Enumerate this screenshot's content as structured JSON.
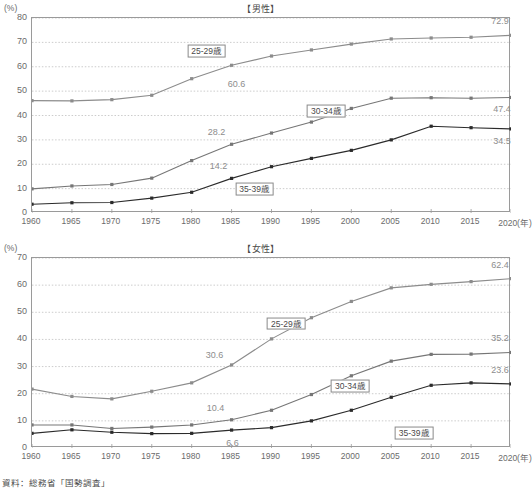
{
  "figure": {
    "source_note": "資料：総務省「国勢調査」",
    "axis_unit": "(%)",
    "x_axis_suffix": "(年)",
    "colors": {
      "series_25_29": "#8c8c8c",
      "series_30_34": "#767676",
      "series_35_39": "#2b2b2b",
      "grid": "#bfbfbf",
      "frame": "#9a9a9a",
      "label_text": "#8d8d8d"
    }
  },
  "charts": [
    {
      "id": "male",
      "title": "【男性】",
      "chart_data": {
        "type": "line",
        "title": "【男性】",
        "xlabel": "(年)",
        "ylabel": "(%)",
        "ylim": [
          0,
          80
        ],
        "ytick_step": 10,
        "yticks": [
          0,
          10,
          20,
          30,
          40,
          50,
          60,
          70,
          80
        ],
        "grid": true,
        "legend": "inline-labels",
        "categories": [
          1960,
          1965,
          1970,
          1975,
          1980,
          1985,
          1990,
          1995,
          2000,
          2005,
          2010,
          2015,
          2020
        ],
        "series": [
          {
            "name": "25-29歳",
            "color": "#8c8c8c",
            "values": [
              46.1,
              46.0,
              46.5,
              48.3,
              55.1,
              60.6,
              64.4,
              66.9,
              69.3,
              71.4,
              71.8,
              72.1,
              72.9
            ],
            "point_labels": [
              {
                "x": 1985,
                "text": "60.6"
              },
              {
                "x": 2020,
                "text": "72.9"
              }
            ]
          },
          {
            "name": "30-34歳",
            "color": "#767676",
            "values": [
              9.9,
              11.1,
              11.7,
              14.3,
              21.5,
              28.2,
              32.8,
              37.3,
              42.9,
              47.1,
              47.3,
              47.1,
              47.4
            ],
            "point_labels": [
              {
                "x": 1985,
                "text": "28.2"
              },
              {
                "x": 2020,
                "text": "47.4"
              }
            ]
          },
          {
            "name": "35-39歳",
            "color": "#2b2b2b",
            "values": [
              3.6,
              4.2,
              4.3,
              6.1,
              8.5,
              14.2,
              19.0,
              22.4,
              25.7,
              30.0,
              35.6,
              35.0,
              34.5
            ],
            "point_labels": [
              {
                "x": 1985,
                "text": "14.2"
              },
              {
                "x": 2020,
                "text": "34.5"
              }
            ]
          }
        ]
      },
      "tags": [
        {
          "label": "25-29歳",
          "x": 1982,
          "y": 66.0
        },
        {
          "label": "30-34歳",
          "x": 1997,
          "y": 41.5
        },
        {
          "label": "35-39歳",
          "x": 1988,
          "y": 9.6
        }
      ],
      "xticks": [
        "1960",
        "1965",
        "1970",
        "1975",
        "1980",
        "1985",
        "1990",
        "1995",
        "2000",
        "2005",
        "2010",
        "2015",
        "2020"
      ]
    },
    {
      "id": "female",
      "title": "【女性】",
      "chart_data": {
        "type": "line",
        "title": "【女性】",
        "xlabel": "(年)",
        "ylabel": "(%)",
        "ylim": [
          0,
          70
        ],
        "ytick_step": 10,
        "yticks": [
          0,
          10,
          20,
          30,
          40,
          50,
          60,
          70
        ],
        "grid": true,
        "legend": "inline-labels",
        "categories": [
          1960,
          1965,
          1970,
          1975,
          1980,
          1985,
          1990,
          1995,
          2000,
          2005,
          2010,
          2015,
          2020
        ],
        "series": [
          {
            "name": "25-29歳",
            "color": "#8c8c8c",
            "values": [
              21.7,
              19.0,
              18.1,
              20.9,
              24.0,
              30.6,
              40.2,
              48.0,
              54.0,
              59.0,
              60.3,
              61.3,
              62.4
            ],
            "point_labels": [
              {
                "x": 1985,
                "text": "30.6"
              },
              {
                "x": 2020,
                "text": "62.4"
              }
            ]
          },
          {
            "name": "30-34歳",
            "color": "#767676",
            "values": [
              8.5,
              8.5,
              7.2,
              7.7,
              8.5,
              10.4,
              13.9,
              19.7,
              26.6,
              32.0,
              34.5,
              34.6,
              35.2
            ],
            "point_labels": [
              {
                "x": 1985,
                "text": "10.4"
              },
              {
                "x": 2020,
                "text": "35.2"
              }
            ]
          },
          {
            "name": "35-39歳",
            "color": "#2b2b2b",
            "values": [
              5.4,
              6.7,
              5.8,
              5.3,
              5.4,
              6.6,
              7.5,
              10.0,
              13.9,
              18.7,
              23.1,
              24.0,
              23.6
            ],
            "point_labels": [
              {
                "x": 1985,
                "text": "6.6"
              },
              {
                "x": 2020,
                "text": "23.6"
              }
            ]
          }
        ]
      },
      "tags": [
        {
          "label": "25-29歳",
          "x": 1992,
          "y": 45.5
        },
        {
          "label": "30-34歳",
          "x": 2000,
          "y": 22.5
        },
        {
          "label": "35-39歳",
          "x": 2008,
          "y": 5.1
        }
      ],
      "xticks": [
        "1960",
        "1965",
        "1970",
        "1975",
        "1980",
        "1985",
        "1990",
        "1995",
        "2000",
        "2005",
        "2010",
        "2015",
        "2020"
      ]
    }
  ]
}
